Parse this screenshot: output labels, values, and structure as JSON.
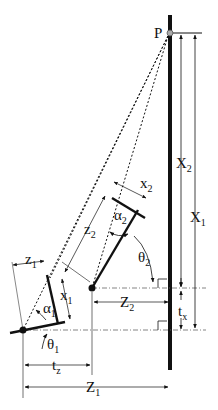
{
  "diagram": {
    "point_label": "P",
    "labels": {
      "X1": {
        "main": "X",
        "sub": "1"
      },
      "X2": {
        "main": "X",
        "sub": "2"
      },
      "tx": {
        "main": "t",
        "sub": "x"
      },
      "tz": {
        "main": "t",
        "sub": "z"
      },
      "Z1": {
        "main": "Z",
        "sub": "1"
      },
      "Z2": {
        "main": "Z",
        "sub": "2"
      },
      "z1": {
        "main": "z",
        "sub": "1"
      },
      "z2": {
        "main": "z",
        "sub": "2"
      },
      "x1": {
        "main": "x",
        "sub": "1"
      },
      "x2": {
        "main": "x",
        "sub": "2"
      },
      "alpha1": {
        "main": "α",
        "sub": "1"
      },
      "alpha2": {
        "main": "α",
        "sub": "2"
      },
      "theta1": {
        "main": "θ",
        "sub": "1"
      },
      "theta2": {
        "main": "θ",
        "sub": "2"
      }
    },
    "colors": {
      "line": "#111111",
      "point_fill": "#aaaaaa"
    }
  }
}
